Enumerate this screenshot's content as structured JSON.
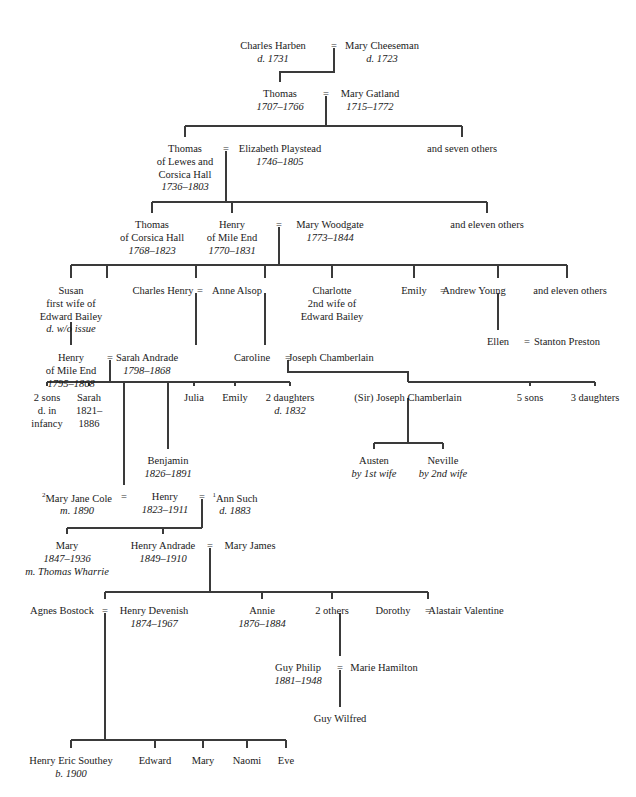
{
  "chart_type": "genealogical-family-tree",
  "marriage_symbol": "=",
  "colors": {
    "ink": "#1a1a1a",
    "line": "#3a3a3a",
    "background": "#ffffff"
  },
  "nodes": [
    {
      "id": "charles-harben",
      "name": "Charles Harben",
      "dates": "d. 1731",
      "x": 273,
      "y": 40
    },
    {
      "id": "mary-cheeseman",
      "name": "Mary Cheeseman",
      "dates": "d. 1723",
      "x": 382,
      "y": 40
    },
    {
      "id": "thomas-1707",
      "name": "Thomas",
      "dates": "1707–1766",
      "x": 280,
      "y": 88
    },
    {
      "id": "mary-gatland",
      "name": "Mary Gatland",
      "dates": "1715–1772",
      "x": 370,
      "y": 88
    },
    {
      "id": "thomas-lewes",
      "name": "Thomas",
      "lines": [
        "of Lewes and",
        "Corsica Hall"
      ],
      "dates": "1736–1803",
      "x": 185,
      "y": 143
    },
    {
      "id": "elizabeth-playstead",
      "name": "Elizabeth Playstead",
      "dates": "1746–1805",
      "x": 280,
      "y": 143
    },
    {
      "id": "and-seven-others",
      "name": "and seven others",
      "dates": "",
      "x": 462,
      "y": 143
    },
    {
      "id": "thomas-corsica",
      "name": "Thomas",
      "lines": [
        "of Corsica Hall"
      ],
      "dates": "1768–1823",
      "x": 152,
      "y": 219
    },
    {
      "id": "henry-mile-end-1770",
      "name": "Henry",
      "lines": [
        "of Mile End"
      ],
      "dates": "1770–1831",
      "x": 232,
      "y": 219
    },
    {
      "id": "mary-woodgate",
      "name": "Mary Woodgate",
      "dates": "1773–1844",
      "x": 330,
      "y": 219
    },
    {
      "id": "and-eleven-others-a",
      "name": "and eleven others",
      "dates": "",
      "x": 487,
      "y": 219
    },
    {
      "id": "susan",
      "name": "Susan",
      "lines": [
        "first wife of",
        "Edward Bailey"
      ],
      "dates": "d. w/o issue",
      "x": 71,
      "y": 285
    },
    {
      "id": "charles-henry",
      "name": "Charles Henry",
      "dates": "",
      "x": 163,
      "y": 285
    },
    {
      "id": "anne-alsop",
      "name": "Anne Alsop",
      "dates": "",
      "x": 237,
      "y": 285
    },
    {
      "id": "charlotte",
      "name": "Charlotte",
      "lines": [
        "2nd wife of",
        "Edward Bailey"
      ],
      "dates": "",
      "x": 332,
      "y": 285
    },
    {
      "id": "emily-young",
      "name": "Emily",
      "dates": "",
      "x": 414,
      "y": 285
    },
    {
      "id": "andrew-young",
      "name": "Andrew Young",
      "dates": "",
      "x": 474,
      "y": 285
    },
    {
      "id": "and-eleven-others-b",
      "name": "and eleven others",
      "dates": "",
      "x": 570,
      "y": 285
    },
    {
      "id": "ellen",
      "name": "Ellen",
      "dates": "",
      "x": 498,
      "y": 336
    },
    {
      "id": "stanton-preston",
      "name": "Stanton Preston",
      "dates": "",
      "x": 567,
      "y": 336
    },
    {
      "id": "henry-mile-end-1795",
      "name": "Henry",
      "lines": [
        "of Mile End"
      ],
      "dates": "1795–1868",
      "x": 71,
      "y": 352
    },
    {
      "id": "sarah-andrade",
      "name": "Sarah Andrade",
      "dates": "1798–1868",
      "x": 147,
      "y": 352
    },
    {
      "id": "caroline",
      "name": "Caroline",
      "dates": "",
      "x": 252,
      "y": 352
    },
    {
      "id": "joseph-chamberlain",
      "name": "Joseph Chamberlain",
      "dates": "",
      "x": 331,
      "y": 352
    },
    {
      "id": "two-sons",
      "name": "2 sons",
      "lines": [
        "d. in",
        "infancy"
      ],
      "dates": "",
      "x": 47,
      "y": 392
    },
    {
      "id": "sarah-1821",
      "name": "Sarah",
      "lines": [
        "1821–",
        "1886"
      ],
      "dates": "",
      "x": 89,
      "y": 392
    },
    {
      "id": "julia",
      "name": "Julia",
      "dates": "",
      "x": 194,
      "y": 392
    },
    {
      "id": "emily-2",
      "name": "Emily",
      "dates": "",
      "x": 235,
      "y": 392
    },
    {
      "id": "two-daughters",
      "name": "2 daughters",
      "dates": "d. 1832",
      "x": 290,
      "y": 392
    },
    {
      "id": "sir-joseph-chamberlain",
      "name": "(Sir) Joseph Chamberlain",
      "dates": "",
      "x": 408,
      "y": 392
    },
    {
      "id": "five-sons",
      "name": "5 sons",
      "dates": "",
      "x": 530,
      "y": 392
    },
    {
      "id": "three-daughters",
      "name": "3 daughters",
      "dates": "",
      "x": 595,
      "y": 392
    },
    {
      "id": "benjamin",
      "name": "Benjamin",
      "dates": "1826–1891",
      "x": 168,
      "y": 455
    },
    {
      "id": "austen",
      "name": "Austen",
      "dates": "by 1st wife",
      "x": 374,
      "y": 455
    },
    {
      "id": "neville",
      "name": "Neville",
      "dates": "by 2nd wife",
      "x": 443,
      "y": 455
    },
    {
      "id": "mary-jane-cole",
      "name": "Mary Jane Cole",
      "dates": "m. 1890",
      "sup": "2",
      "x": 77,
      "y": 491
    },
    {
      "id": "henry-1823",
      "name": "Henry",
      "dates": "1823–1911",
      "x": 165,
      "y": 491
    },
    {
      "id": "ann-such",
      "name": "Ann Such",
      "dates": "d. 1883",
      "sup": "1",
      "x": 235,
      "y": 491
    },
    {
      "id": "mary-1847",
      "name": "Mary",
      "dates": "1847–1936",
      "note": "m. Thomas Wharrie",
      "x": 67,
      "y": 540
    },
    {
      "id": "henry-andrade",
      "name": "Henry Andrade",
      "dates": "1849–1910",
      "x": 163,
      "y": 540
    },
    {
      "id": "mary-james",
      "name": "Mary James",
      "dates": "",
      "x": 250,
      "y": 540
    },
    {
      "id": "agnes-bostock",
      "name": "Agnes Bostock",
      "dates": "",
      "x": 62,
      "y": 605
    },
    {
      "id": "henry-devenish",
      "name": "Henry Devenish",
      "dates": "1874–1967",
      "x": 154,
      "y": 605
    },
    {
      "id": "annie",
      "name": "Annie",
      "dates": "1876–1884",
      "x": 262,
      "y": 605
    },
    {
      "id": "two-others",
      "name": "2 others",
      "dates": "",
      "x": 332,
      "y": 605
    },
    {
      "id": "dorothy",
      "name": "Dorothy",
      "dates": "",
      "x": 393,
      "y": 605
    },
    {
      "id": "alastair-valentine",
      "name": "Alastair Valentine",
      "dates": "",
      "x": 466,
      "y": 605
    },
    {
      "id": "guy-philip",
      "name": "Guy Philip",
      "dates": "1881–1948",
      "x": 298,
      "y": 662
    },
    {
      "id": "marie-hamilton",
      "name": "Marie Hamilton",
      "dates": "",
      "x": 384,
      "y": 662
    },
    {
      "id": "guy-wilfred",
      "name": "Guy Wilfred",
      "dates": "",
      "x": 340,
      "y": 713
    },
    {
      "id": "henry-eric-southey",
      "name": "Henry Eric Southey",
      "dates": "b. 1900",
      "x": 71,
      "y": 755
    },
    {
      "id": "edward",
      "name": "Edward",
      "dates": "",
      "x": 155,
      "y": 755
    },
    {
      "id": "mary-b",
      "name": "Mary",
      "dates": "",
      "x": 203,
      "y": 755
    },
    {
      "id": "naomi",
      "name": "Naomi",
      "dates": "",
      "x": 247,
      "y": 755
    },
    {
      "id": "eve",
      "name": "Eve",
      "dates": "",
      "x": 286,
      "y": 755
    }
  ],
  "marriages": [
    {
      "id": "m-charles-mary",
      "x": 334,
      "y": 40
    },
    {
      "id": "m-thomas-gatland",
      "x": 326,
      "y": 88
    },
    {
      "id": "m-thomas-elizabeth",
      "x": 226,
      "y": 143
    },
    {
      "id": "m-henry-woodgate",
      "x": 279,
      "y": 219
    },
    {
      "id": "m-charlesh-anne",
      "x": 200,
      "y": 285
    },
    {
      "id": "m-emily-andrew",
      "x": 443,
      "y": 285
    },
    {
      "id": "m-ellen-stanton",
      "x": 527,
      "y": 336
    },
    {
      "id": "m-henry-sarah",
      "x": 110,
      "y": 352
    },
    {
      "id": "m-caroline-joseph",
      "x": 288,
      "y": 352
    },
    {
      "id": "m-cole-henry",
      "x": 124,
      "y": 491
    },
    {
      "id": "m-henry-such",
      "x": 202,
      "y": 491
    },
    {
      "id": "m-andrade-james",
      "x": 210,
      "y": 540
    },
    {
      "id": "m-agnes-devenish",
      "x": 105,
      "y": 605
    },
    {
      "id": "m-dorothy-alastair",
      "x": 428,
      "y": 605
    },
    {
      "id": "m-guy-marie",
      "x": 340,
      "y": 662
    }
  ]
}
